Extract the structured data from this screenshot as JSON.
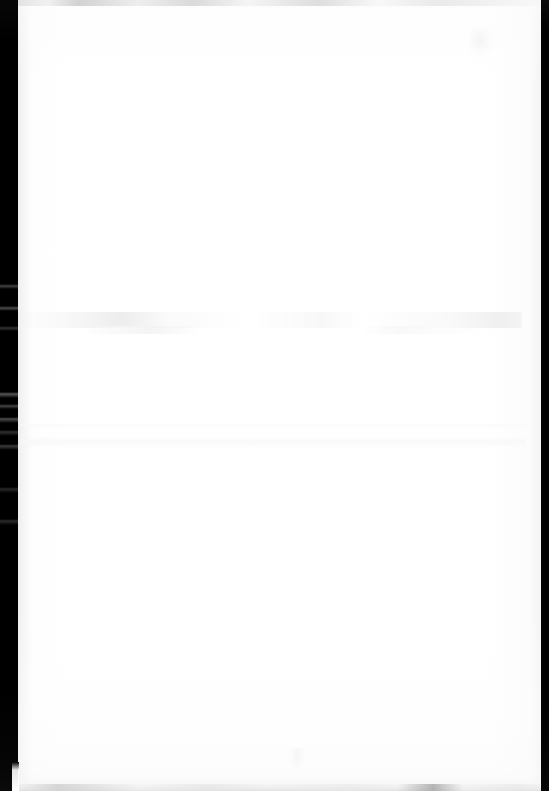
{
  "document": {
    "kind": "scanned-page",
    "page_content_text": "",
    "visible_text_lines": [],
    "page_width_px": 549,
    "page_height_px": 791
  },
  "colors": {
    "page_background": "#ffffff",
    "paper": "#fefefe",
    "scanner_border": "#000000",
    "edge_band_gray": "#e2e2e2",
    "ghost_mark_gray": "#f0f0f0"
  },
  "regions": {
    "paper": {
      "label": "",
      "left": 18,
      "top": 0,
      "width": 523,
      "height": 791
    },
    "border_left": {
      "label": "",
      "left": 0,
      "top": 0,
      "width": 18,
      "height": 791
    },
    "border_right": {
      "label": "",
      "left": 541,
      "top": 0,
      "width": 8,
      "height": 791
    },
    "band_top": {
      "label": "",
      "left": 18,
      "top": 0,
      "width": 523,
      "height": 6
    },
    "band_bottom": {
      "label": "",
      "left": 18,
      "top": 778,
      "width": 523,
      "height": 13
    },
    "ghost_band_mid": {
      "label": "",
      "left": 22,
      "top": 312,
      "width": 500,
      "height": 16
    },
    "ghost_band_lower": {
      "label": "",
      "left": 20,
      "top": 424,
      "width": 505,
      "height": 28
    },
    "smudge_top_right": {
      "label": "",
      "left": 470,
      "top": 28,
      "width": 26,
      "height": 30
    },
    "smudge_bottom_center": {
      "label": "",
      "left": 288,
      "top": 748,
      "width": 18,
      "height": 26
    }
  }
}
